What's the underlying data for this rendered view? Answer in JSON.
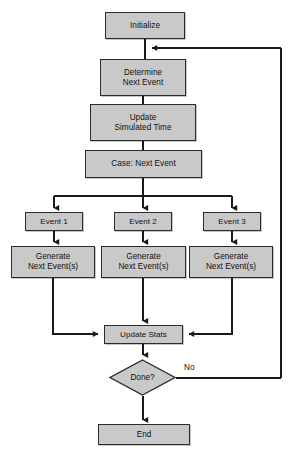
{
  "diagram": {
    "style": {
      "node_fill": "#c9c9c9",
      "node_border": "#2b2b2b",
      "line_color": "#1a1a1a",
      "background": "#ffffff",
      "text_color": "#111111"
    },
    "nodes": [
      {
        "id": "initialize",
        "label": "Initialize",
        "shape": "rect",
        "x": 105,
        "y": 12,
        "w": 80,
        "h": 27
      },
      {
        "id": "determine",
        "label": "Determine\nNext Event",
        "shape": "rect",
        "x": 100,
        "y": 59,
        "w": 86,
        "h": 37
      },
      {
        "id": "update_time",
        "label": "Update\nSimulated Time",
        "shape": "rect",
        "x": 90,
        "y": 104,
        "w": 106,
        "h": 37
      },
      {
        "id": "case",
        "label": "Case: Next Event",
        "shape": "rect",
        "x": 85,
        "y": 150,
        "w": 117,
        "h": 28
      },
      {
        "id": "event1",
        "label": "Event 1",
        "shape": "rect",
        "x": 25,
        "y": 212,
        "w": 58,
        "h": 19
      },
      {
        "id": "event2",
        "label": "Event 2",
        "shape": "rect",
        "x": 114,
        "y": 212,
        "w": 58,
        "h": 19
      },
      {
        "id": "event3",
        "label": "Event 3",
        "shape": "rect",
        "x": 203,
        "y": 212,
        "w": 58,
        "h": 19
      },
      {
        "id": "gen1",
        "label": "Generate\nNext Event(s)",
        "shape": "rect",
        "x": 11,
        "y": 246,
        "w": 84,
        "h": 32
      },
      {
        "id": "gen2",
        "label": "Generate\nNext Event(s)",
        "shape": "rect",
        "x": 101,
        "y": 246,
        "w": 85,
        "h": 32
      },
      {
        "id": "gen3",
        "label": "Generate\nNext Event(s)",
        "shape": "rect",
        "x": 189,
        "y": 246,
        "w": 84,
        "h": 32
      },
      {
        "id": "update_stats",
        "label": "Update Stats",
        "shape": "rect",
        "x": 104,
        "y": 325,
        "w": 79,
        "h": 19
      },
      {
        "id": "done",
        "label": "Done?",
        "shape": "diamond",
        "x": 109,
        "y": 359,
        "w": 67,
        "h": 37
      },
      {
        "id": "end",
        "label": "End",
        "shape": "rect",
        "x": 98,
        "y": 424,
        "w": 92,
        "h": 21
      }
    ],
    "edge_labels": [
      {
        "id": "no-label",
        "text": "No",
        "x": 184,
        "y": 363
      }
    ],
    "edges": [
      {
        "from": "initialize",
        "to": "determine",
        "kind": "straight-down"
      },
      {
        "from": "determine",
        "to": "update_time",
        "kind": "straight-down"
      },
      {
        "from": "update_time",
        "to": "case",
        "kind": "straight-down"
      },
      {
        "from": "case",
        "to": "event1",
        "kind": "fanout-left"
      },
      {
        "from": "case",
        "to": "event2",
        "kind": "fanout-center"
      },
      {
        "from": "case",
        "to": "event3",
        "kind": "fanout-right"
      },
      {
        "from": "event1",
        "to": "gen1",
        "kind": "straight-down"
      },
      {
        "from": "event2",
        "to": "gen2",
        "kind": "straight-down"
      },
      {
        "from": "event3",
        "to": "gen3",
        "kind": "straight-down"
      },
      {
        "from": "gen1",
        "to": "update_stats",
        "kind": "elbow-right"
      },
      {
        "from": "gen2",
        "to": "update_stats",
        "kind": "straight-down"
      },
      {
        "from": "gen3",
        "to": "update_stats",
        "kind": "elbow-left"
      },
      {
        "from": "update_stats",
        "to": "done",
        "kind": "straight-down"
      },
      {
        "from": "done",
        "to": "end",
        "kind": "straight-down"
      },
      {
        "from": "done",
        "to": "determine",
        "kind": "feedback-loop-right",
        "label": "No"
      }
    ]
  }
}
